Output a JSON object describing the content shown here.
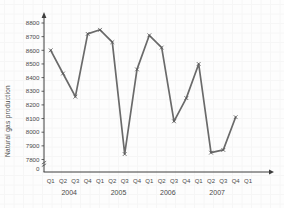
{
  "chart_data": {
    "type": "line",
    "title": "",
    "ylabel": "Natural gas production",
    "xlabel": "",
    "categories": [
      "2004 Q1",
      "2004 Q2",
      "2004 Q3",
      "2004 Q4",
      "2005 Q1",
      "2005 Q2",
      "2005 Q3",
      "2005 Q4",
      "2006 Q1",
      "2006 Q2",
      "2006 Q3",
      "2006 Q4",
      "2007 Q1",
      "2007 Q2",
      "2007 Q3",
      "2007 Q4"
    ],
    "x_quarter_labels": [
      "Q1",
      "Q2",
      "Q3",
      "Q4",
      "Q1",
      "Q2",
      "Q3",
      "Q4",
      "Q1",
      "Q2",
      "Q3",
      "Q4",
      "Q1",
      "Q2",
      "Q3",
      "Q4",
      "Q1"
    ],
    "year_labels": [
      "2004",
      "2005",
      "2006",
      "2007"
    ],
    "series": [
      {
        "name": "Natural gas production",
        "values": [
          8600,
          8430,
          8260,
          8720,
          8750,
          8660,
          7840,
          8460,
          8710,
          8620,
          8080,
          8250,
          8500,
          7850,
          7870,
          8110
        ]
      }
    ],
    "yticks": [
      7800,
      7900,
      8000,
      8100,
      8200,
      8300,
      8400,
      8500,
      8600,
      8700,
      8800
    ],
    "origin_label": "0",
    "axis_break": true,
    "ylim": [
      7800,
      8800
    ],
    "grid": "faint",
    "legend": "none",
    "marker": "x",
    "colors": {
      "line": "#6a6a6a",
      "marker": "#565656",
      "axis": "#3d3d3d",
      "tick_text": "#4a4a4a",
      "grid": "#f6f6f6",
      "background": "#fdfdfd"
    }
  }
}
